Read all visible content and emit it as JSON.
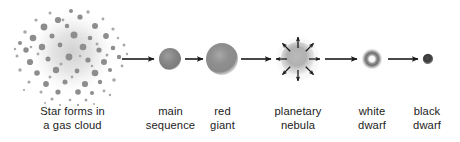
{
  "figure": {
    "background_color": "#ffffff",
    "text_color": "#1c1c1c",
    "arrow_color": "#1a1a1a",
    "width": 460,
    "height": 142
  },
  "stages": [
    {
      "id": "gas-cloud",
      "label_line1": "Star forms in",
      "label_line2": "a gas cloud",
      "icon": "gas-cloud-icon",
      "center_x": 72,
      "center_y": 52,
      "radius": 48,
      "color": "#8a8a8a"
    },
    {
      "id": "main-sequence",
      "label_line1": "main",
      "label_line2": "sequence",
      "icon": "main-sequence-star-icon",
      "center_x": 170,
      "center_y": 59,
      "radius": 11,
      "color": "#7a7a7a"
    },
    {
      "id": "red-giant",
      "label_line1": "red",
      "label_line2": "giant",
      "icon": "red-giant-star-icon",
      "center_x": 222,
      "center_y": 59,
      "radius": 16,
      "color": "#8d8d8d"
    },
    {
      "id": "planetary-nebula",
      "label_line1": "planetary",
      "label_line2": "nebula",
      "icon": "planetary-nebula-icon",
      "center_x": 298,
      "center_y": 59,
      "radius": 22,
      "color": "#9a9a9a",
      "ejection_arrows": 8
    },
    {
      "id": "white-dwarf",
      "label_line1": "white",
      "label_line2": "dwarf",
      "icon": "white-dwarf-icon",
      "center_x": 372,
      "center_y": 59,
      "radius": 11,
      "color": "#6f6f6f"
    },
    {
      "id": "black-dwarf",
      "label_line1": "black",
      "label_line2": "dwarf",
      "icon": "black-dwarf-icon",
      "center_x": 428,
      "center_y": 59,
      "radius": 5,
      "color": "#3a3a3a"
    }
  ],
  "transitions": [
    {
      "id": "arrow-cloud-to-main",
      "from": "gas-cloud",
      "to": "main-sequence",
      "x1": 122,
      "x2": 155,
      "y": 59
    },
    {
      "id": "arrow-main-to-giant",
      "from": "main-sequence",
      "to": "red-giant",
      "x1": 185,
      "x2": 204,
      "y": 59
    },
    {
      "id": "arrow-giant-to-nebula",
      "from": "red-giant",
      "to": "planetary-nebula",
      "x1": 241,
      "x2": 272,
      "y": 59
    },
    {
      "id": "arrow-nebula-to-white",
      "from": "planetary-nebula",
      "to": "white-dwarf",
      "x1": 325,
      "x2": 358,
      "y": 59
    },
    {
      "id": "arrow-white-to-black",
      "from": "white-dwarf",
      "to": "black-dwarf",
      "x1": 388,
      "x2": 419,
      "y": 59
    }
  ]
}
